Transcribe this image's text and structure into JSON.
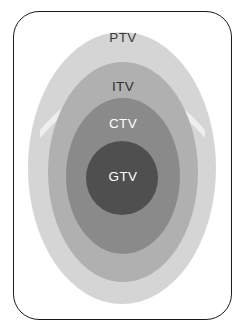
{
  "figure": {
    "frame": {
      "border_color": "#1b1b1b",
      "background": "#ffffff",
      "corner_radius": 26
    },
    "background": "#ffffff",
    "volumes": [
      {
        "id": "ptv",
        "label": "PTV",
        "name": "planning-target-volume",
        "fill": "#d5d5d5",
        "label_color": "#3a3a3a",
        "cx": 122,
        "cy": 168,
        "rx": 94,
        "ry": 136
      },
      {
        "id": "itv",
        "label": "ITV",
        "name": "internal-target-volume",
        "fill": "#b0b0b0",
        "label_color": "#2f2f2f",
        "cx": 123,
        "cy": 172,
        "rx": 75,
        "ry": 110
      },
      {
        "id": "ctv",
        "label": "CTV",
        "name": "clinical-target-volume",
        "fill": "#8a8a8a",
        "label_color": "#ffffff",
        "cx": 123,
        "cy": 176,
        "rx": 57,
        "ry": 78
      },
      {
        "id": "gtv",
        "label": "GTV",
        "name": "gross-tumor-volume",
        "fill": "#4f4f4f",
        "label_color": "#ffffff",
        "cx": 122,
        "cy": 178,
        "rx": 36,
        "ry": 37
      }
    ],
    "separator_arc": {
      "name": "ptv-itv-highlight-arc",
      "color": "#f2f2f2"
    }
  }
}
